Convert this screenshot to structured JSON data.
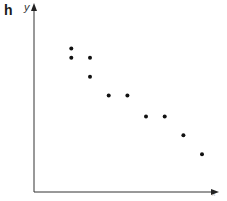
{
  "figure": {
    "panel_label": "h",
    "y_axis_label": "y",
    "x_axis_label": "x"
  },
  "chart_data": {
    "type": "scatter",
    "title": "",
    "panel_label": "h",
    "xlabel": "x",
    "ylabel": "y",
    "grid": false,
    "legend": null,
    "ticks": "none",
    "xlim": [
      0,
      10
    ],
    "ylim": [
      0,
      10
    ],
    "points": [
      {
        "x": 2.0,
        "y": 7.6
      },
      {
        "x": 2.0,
        "y": 7.1
      },
      {
        "x": 3.0,
        "y": 7.1
      },
      {
        "x": 3.0,
        "y": 6.1
      },
      {
        "x": 4.0,
        "y": 5.1
      },
      {
        "x": 5.0,
        "y": 5.1
      },
      {
        "x": 6.0,
        "y": 4.0
      },
      {
        "x": 7.0,
        "y": 4.0
      },
      {
        "x": 8.0,
        "y": 3.0
      },
      {
        "x": 9.0,
        "y": 2.0
      }
    ],
    "trend": "negative correlation"
  }
}
